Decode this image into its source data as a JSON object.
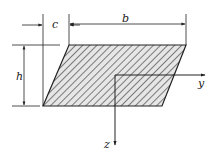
{
  "diagram": {
    "type": "cross-section",
    "shape": "parallelogram",
    "fill_pattern": "diagonal-hatch",
    "labels": {
      "c": "c",
      "b": "b",
      "h": "h",
      "y": "y",
      "z": "z"
    },
    "colors": {
      "stroke": "#222222",
      "hatch": "#333333",
      "background": "#ffffff"
    }
  }
}
